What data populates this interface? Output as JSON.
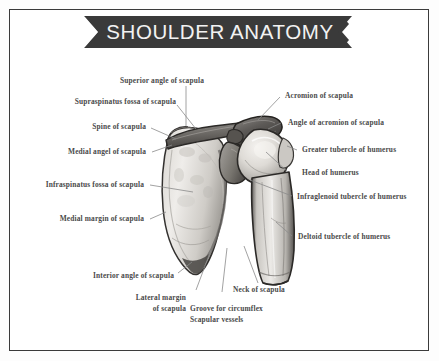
{
  "title": "SHOULDER ANATOMY",
  "colors": {
    "banner": "#3a3a3a",
    "banner_text": "#f2f2f2",
    "frame_border": "#3b3b3b",
    "label_text": "#4a4a4a",
    "leader_line": "#8a8a8a",
    "background": "#ffffff",
    "bone_outline": "#2e2e2e",
    "bone_fill_light": "#e8e6e2",
    "bone_fill_mid": "#b9b6b1",
    "bone_fill_dark": "#7d7a76"
  },
  "labels": {
    "left": [
      {
        "id": "superior-angle-of-scapula",
        "text": "Superior angle of scapula"
      },
      {
        "id": "supraspinatus-fossa-of-scapula",
        "text": "Supraspinatus fossa of scapula"
      },
      {
        "id": "spine-of-scapula",
        "text": "Spine of scapula"
      },
      {
        "id": "medial-angel-of-scapula",
        "text": "Medial angel of scapula"
      },
      {
        "id": "infraspinatus-fossa-of-scapula",
        "text": "Infraspinatus fossa of scapula"
      },
      {
        "id": "medial-margin-of-scapula",
        "text": "Medial margin of scapula"
      },
      {
        "id": "interior-angle-of-scapula",
        "text": "Interior angle of scapula"
      }
    ],
    "right": [
      {
        "id": "acromion-of-scapula",
        "text": "Acromion of scapula"
      },
      {
        "id": "angle-of-acromion-of-scapula",
        "text": "Angle of acromion of scapula"
      },
      {
        "id": "greater-tubercle-of-humerus",
        "text": "Greater tubercle of humerus"
      },
      {
        "id": "head-of-humerus",
        "text": "Head of humerus"
      },
      {
        "id": "infraglenoid-tubercle-of-humerus",
        "text": "Infraglenoid tubercle of humerus"
      },
      {
        "id": "deltoid-tubercle-of-humerus",
        "text": "Deltoid tubercle of humerus"
      }
    ],
    "bottom": [
      {
        "id": "lateral-margin-of-scapula",
        "line1": "Lateral margin",
        "line2": "of scapula"
      },
      {
        "id": "groove-for-circumflex-scapular-vessels",
        "line1": "Groove for circumflex",
        "line2": "Scapular vessels"
      },
      {
        "id": "neck-of-scapula",
        "line1": "Neck of scapula",
        "line2": ""
      }
    ]
  },
  "diagram": {
    "name": "scapula-and-humerus-illustration",
    "structures": [
      "scapula-blade",
      "spine-of-scapula",
      "acromion",
      "coracoid-process",
      "glenoid-cavity",
      "humeral-head",
      "humeral-shaft"
    ]
  }
}
